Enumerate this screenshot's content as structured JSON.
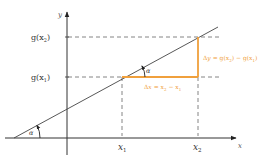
{
  "diagram": {
    "colors": {
      "axis": "#333333",
      "line": "#444444",
      "dashed": "#555555",
      "highlight": "#f0a03c",
      "label": "#333333",
      "highlight_label": "#f0a03c"
    },
    "axes": {
      "x_label": "x",
      "y_label": "y"
    },
    "y_ticks": {
      "g_x2": {
        "prefix": "g(x",
        "sub": "2",
        "suffix": ")"
      },
      "g_x1": {
        "prefix": "g(x",
        "sub": "1",
        "suffix": ")"
      }
    },
    "x_ticks": {
      "x1": {
        "main": "x",
        "sub": "1"
      },
      "x2": {
        "main": "x",
        "sub": "2"
      }
    },
    "angle_label": "α",
    "delta_y": {
      "delta": "Δ",
      "var": "y",
      "eq": " = g(x",
      "sub2": "2",
      "mid": ") − g(x",
      "sub1": "1",
      "end": ")"
    },
    "delta_x": {
      "delta": "Δ",
      "var": "x",
      "eq": " = x",
      "sub2": "2",
      "mid": " − x",
      "sub1": "1"
    }
  }
}
